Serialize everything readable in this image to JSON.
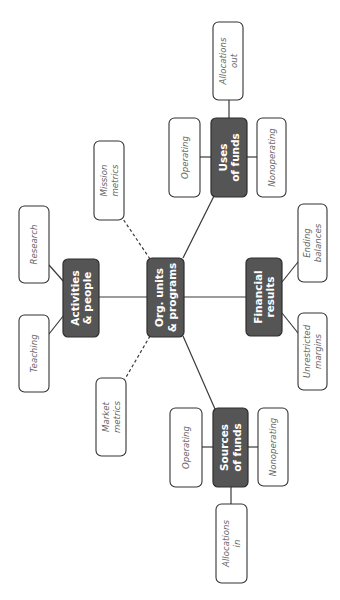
{
  "diagram": {
    "title": "",
    "nodes": [
      {
        "id": "center",
        "kind": "dark",
        "lines": [
          "Org. units",
          "& programs"
        ]
      },
      {
        "id": "activities",
        "kind": "dark",
        "lines": [
          "Activities",
          "& people"
        ]
      },
      {
        "id": "research",
        "kind": "light",
        "lines": [
          "Research"
        ]
      },
      {
        "id": "teaching",
        "kind": "light",
        "lines": [
          "Teaching"
        ]
      },
      {
        "id": "mission",
        "kind": "light",
        "lines": [
          "Mission",
          "metrics"
        ]
      },
      {
        "id": "market",
        "kind": "light",
        "lines": [
          "Market",
          "metrics"
        ]
      },
      {
        "id": "uses",
        "kind": "dark",
        "lines": [
          "Uses",
          "of funds"
        ]
      },
      {
        "id": "alloc_out",
        "kind": "light",
        "lines": [
          "Allocations",
          "out"
        ]
      },
      {
        "id": "uses_operating",
        "kind": "light",
        "lines": [
          "Operating"
        ]
      },
      {
        "id": "uses_nonoperating",
        "kind": "light",
        "lines": [
          "Nonoperating"
        ]
      },
      {
        "id": "financial",
        "kind": "dark",
        "lines": [
          "Financial",
          "results"
        ]
      },
      {
        "id": "ending",
        "kind": "light",
        "lines": [
          "Ending",
          "balances"
        ]
      },
      {
        "id": "unrestricted",
        "kind": "light",
        "lines": [
          "Unrestricted",
          "margins"
        ]
      },
      {
        "id": "sources",
        "kind": "dark",
        "lines": [
          "Sources",
          "of funds"
        ]
      },
      {
        "id": "src_operating",
        "kind": "light",
        "lines": [
          "Operating"
        ]
      },
      {
        "id": "src_nonoperating",
        "kind": "light",
        "lines": [
          "Nonoperating"
        ]
      },
      {
        "id": "alloc_in",
        "kind": "light",
        "lines": [
          "Allocations",
          "in"
        ]
      }
    ],
    "edges": [
      {
        "from": "center",
        "to": "activities",
        "style": "solid"
      },
      {
        "from": "center",
        "to": "financial",
        "style": "solid"
      },
      {
        "from": "center",
        "to": "uses",
        "style": "solid"
      },
      {
        "from": "center",
        "to": "sources",
        "style": "solid"
      },
      {
        "from": "center",
        "to": "mission",
        "style": "dashed"
      },
      {
        "from": "center",
        "to": "market",
        "style": "dashed"
      },
      {
        "from": "activities",
        "to": "research",
        "style": "solid"
      },
      {
        "from": "activities",
        "to": "teaching",
        "style": "solid"
      },
      {
        "from": "uses",
        "to": "alloc_out",
        "style": "solid"
      },
      {
        "from": "uses",
        "to": "uses_operating",
        "style": "solid"
      },
      {
        "from": "uses",
        "to": "uses_nonoperating",
        "style": "solid"
      },
      {
        "from": "financial",
        "to": "ending",
        "style": "solid"
      },
      {
        "from": "financial",
        "to": "unrestricted",
        "style": "solid"
      },
      {
        "from": "sources",
        "to": "src_operating",
        "style": "solid"
      },
      {
        "from": "sources",
        "to": "src_nonoperating",
        "style": "solid"
      },
      {
        "from": "sources",
        "to": "alloc_in",
        "style": "solid"
      }
    ]
  }
}
